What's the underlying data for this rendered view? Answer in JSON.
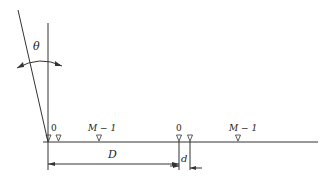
{
  "diagram": {
    "angle_label": "θ",
    "group1": {
      "first_label": "0",
      "last_label": "M − 1"
    },
    "group2": {
      "first_label": "0",
      "last_label": "M − 1"
    },
    "spacing_label": "D",
    "offset_label": "d"
  }
}
